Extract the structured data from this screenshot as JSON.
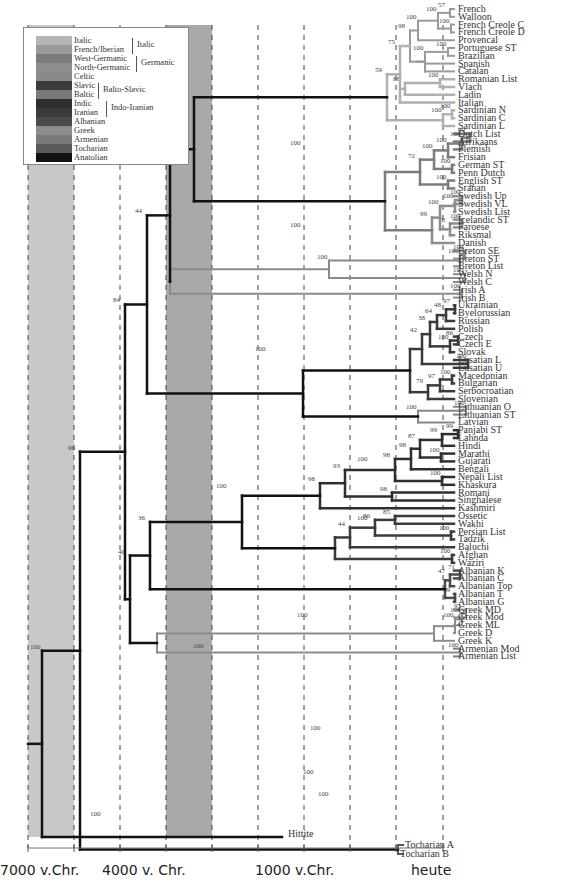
{
  "axis": {
    "labels": [
      {
        "text": "7000 v.Chr.",
        "x": 0
      },
      {
        "text": "4000 v. Chr.",
        "x": 102
      },
      {
        "text": "1000 v.Chr.",
        "x": 255
      },
      {
        "text": "heute",
        "x": 411
      }
    ],
    "gridlines_x": [
      28,
      74,
      120,
      166,
      212,
      258,
      304,
      350,
      396,
      443
    ],
    "bands": [
      {
        "x0": 28,
        "x1": 74,
        "color": "#c8c8c8"
      },
      {
        "x0": 166,
        "x1": 212,
        "color": "#a9a9a9"
      }
    ]
  },
  "legend": {
    "items": [
      {
        "label": "Italic",
        "color": "#b5b5b5"
      },
      {
        "label": "French/Iberian",
        "color": "#9a9a9a"
      },
      {
        "label": "West-Germanic",
        "color": "#7c7c7c"
      },
      {
        "label": "North-Germanic",
        "color": "#8e8e8e"
      },
      {
        "label": "Celtic",
        "color": "#8a8a8a"
      },
      {
        "label": "Slavic",
        "color": "#3c3c3c"
      },
      {
        "label": "Baltic",
        "color": "#7a7a7a"
      },
      {
        "label": "Indic",
        "color": "#2e2e2e"
      },
      {
        "label": "Iranian",
        "color": "#3a3a3a"
      },
      {
        "label": "Albanian",
        "color": "#4a4a4a"
      },
      {
        "label": "Greek",
        "color": "#8c8c8c"
      },
      {
        "label": "Armenian",
        "color": "#7a7a7a"
      },
      {
        "label": "Tocharian",
        "color": "#5a5a5a"
      },
      {
        "label": "Anatolian",
        "color": "#111111"
      }
    ],
    "groups": [
      {
        "label": "Italic",
        "row_from": 0,
        "row_to": 1,
        "x": 108
      },
      {
        "label": "Germanic",
        "row_from": 2,
        "row_to": 3,
        "x": 112
      },
      {
        "label": "Balto-Slavic",
        "row_from": 5,
        "row_to": 6,
        "x": 74
      },
      {
        "label": "Indo-Iranian",
        "row_from": 7,
        "row_to": 8,
        "x": 82
      }
    ]
  },
  "leaves": [
    "French",
    "Walloon",
    "French Creole C",
    "French Creole D",
    "Provencal",
    "Portuguese ST",
    "Brazilian",
    "Spanish",
    "Catalan",
    "Romanian List",
    "Vlach",
    "Ladin",
    "Italian",
    "Sardinian N",
    "Sardinian C",
    "Sardinian L",
    "Dutch List",
    "Afrikaans",
    "Flemish",
    "Frisian",
    "German ST",
    "Penn Dutch",
    "English ST",
    "Sranan",
    "Swedish Up",
    "Swedish VL",
    "Swedish List",
    "Icelandic ST",
    "Faroese",
    "Riksmal",
    "Danish",
    "Breton SE",
    "Breton ST",
    "Breton List",
    "Welsh N",
    "Welsh C",
    "Irish A",
    "Irish B",
    "Ukrainian",
    "Byelorussian",
    "Russian",
    "Polish",
    "Czech",
    "Czech E",
    "Slovak",
    "Lusatian L",
    "Lusatian U",
    "Macedonian",
    "Bulgarian",
    "Serbocroatian",
    "Slovenian",
    "Lithuanian O",
    "Lithuanian ST",
    "Latvian",
    "Panjabi ST",
    "Lahnda",
    "Hindi",
    "Marathi",
    "Gujarati",
    "Bengali",
    "Nepali List",
    "Khaskura",
    "Romani",
    "Singhalese",
    "Kashmiri",
    "Ossetic",
    "Wakhi",
    "Persian List",
    "Tadzik",
    "Baluchi",
    "Afghan",
    "Waziri",
    "Albanian K",
    "Albanian C",
    "Albanian Top",
    "Albanian T",
    "Albanian G",
    "Greek MD",
    "Greek Mod",
    "Greek ML",
    "Greek D",
    "Greek K",
    "Armenian Mod",
    "Armenian List"
  ],
  "special_leaves": [
    {
      "label": "Tocharian A",
      "x": 405,
      "y": 848
    },
    {
      "label": "Tocharian B",
      "x": 400,
      "y": 857
    },
    {
      "label": "Hittite",
      "x": 288,
      "y": 837
    }
  ],
  "chart_data": {
    "type": "dendrogram",
    "xlabel": "time",
    "x_ticks": [
      "7000 v.Chr.",
      "4000 v. Chr.",
      "1000 v.Chr.",
      "heute"
    ],
    "clade_support": [
      {
        "clade": "Root (Hittite vs rest)",
        "value": 100
      },
      {
        "clade": "Tocharian split",
        "value": 96
      },
      {
        "clade": "Armenian+Greek+others",
        "value": 84
      },
      {
        "clade": "Armenian/Greek",
        "value": 40
      },
      {
        "clade": "Italic+Germanic+Celtic+Balto-Slavic",
        "value": 44
      },
      {
        "clade": "Indo-Iranian+Albanian",
        "value": 36
      },
      {
        "clade": "Italic+Germanic+Celtic",
        "value": 67
      },
      {
        "clade": "Italic+Germanic",
        "value": 46
      },
      {
        "clade": "Italic",
        "value": 100
      },
      {
        "clade": "Germanic",
        "value": 100
      },
      {
        "clade": "Celtic",
        "value": 100
      },
      {
        "clade": "Balto-Slavic",
        "value": 100
      },
      {
        "clade": "Indo-Iranian",
        "value": 100
      },
      {
        "clade": "Indic",
        "value": 98
      },
      {
        "clade": "Iranian",
        "value": 100
      },
      {
        "clade": "Albanian",
        "value": 100
      },
      {
        "clade": "Greek",
        "value": 100
      },
      {
        "clade": "Armenian",
        "value": 100
      },
      {
        "clade": "Tocharian",
        "value": 100
      },
      {
        "clade": "Slavic",
        "value": 100
      },
      {
        "clade": "Baltic",
        "value": 100
      }
    ]
  }
}
